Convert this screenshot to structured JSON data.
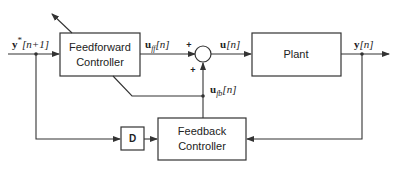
{
  "blocks": {
    "feedforward": {
      "line1": "Feedforward",
      "line2": "Controller"
    },
    "plant": {
      "label": "Plant"
    },
    "delay": {
      "label": "D"
    },
    "feedback": {
      "line1": "Feedback",
      "line2": "Controller"
    }
  },
  "signals": {
    "reference": {
      "base": "y",
      "sup": "*",
      "arg": "[n+1]"
    },
    "u_ff": {
      "base": "u",
      "sub": "ff",
      "arg": "[n]"
    },
    "u": {
      "base": "u",
      "arg": "[n]"
    },
    "u_fb": {
      "base": "u",
      "sub": "fb",
      "arg": "[n]"
    },
    "output": {
      "base": "y",
      "arg": "[n]"
    }
  },
  "summing_junction": {
    "sign_top": "+",
    "sign_bottom": "+"
  },
  "colors": {
    "stroke": "#333333",
    "text": "#222222",
    "background": "#ffffff"
  }
}
